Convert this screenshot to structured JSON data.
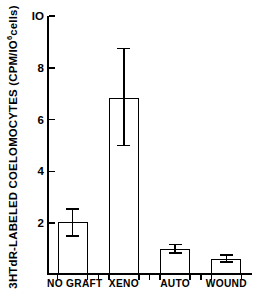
{
  "chart_data": {
    "type": "bar",
    "title": "",
    "xlabel": "",
    "ylabel_parts": {
      "pre": "3HTdR-LABELED COELOMOCYTES (CPM/IO",
      "sup": "6",
      "post": "cells)"
    },
    "ylabel": "3HTdR-LABELED COELOMOCYTES (CPM/IO6cells)",
    "categories": [
      "NO GRAFT",
      "XENO",
      "AUTO",
      "WOUND"
    ],
    "values": [
      2.05,
      6.85,
      1.0,
      0.62
    ],
    "errors_upper": [
      2.55,
      8.75,
      1.17,
      0.78
    ],
    "errors_lower": [
      1.5,
      5.0,
      0.85,
      0.5
    ],
    "ylim": [
      0,
      10
    ],
    "xlim": [
      0,
      4
    ],
    "yticks": [
      2,
      4,
      6,
      8,
      10
    ],
    "ytick_labels": [
      "2",
      "4",
      "6",
      "8",
      "IO"
    ],
    "grid": false,
    "legend": "none",
    "bar_facecolor": "#ffffff",
    "bar_edgecolor": "#000000",
    "axis_color": "#000000",
    "background": "#ffffff"
  }
}
